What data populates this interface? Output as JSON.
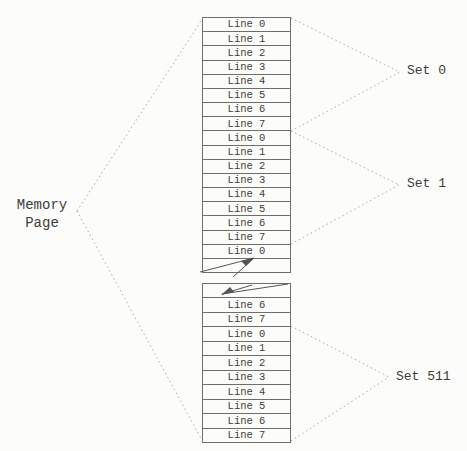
{
  "memory_page": {
    "line1": "Memory",
    "line2": "Page"
  },
  "top_block": {
    "rows": [
      "Line 0",
      "Line 1",
      "Line 2",
      "Line 3",
      "Line 4",
      "Line 5",
      "Line 6",
      "Line 7",
      "Line 0",
      "Line 1",
      "Line 2",
      "Line 3",
      "Line 4",
      "Line 5",
      "Line 6",
      "Line 7",
      "Line 0"
    ]
  },
  "bottom_block": {
    "rows": [
      "Line 6",
      "Line 7",
      "Line 0",
      "Line 1",
      "Line 2",
      "Line 3",
      "Line 4",
      "Line 5",
      "Line 6",
      "Line 7"
    ]
  },
  "set_labels": [
    {
      "label": "Set 0"
    },
    {
      "label": "Set 1"
    },
    {
      "label": "Set 511"
    }
  ],
  "colors": {
    "border": "#6e6e6e",
    "text": "#3c3c3c",
    "dotted": "#a8a8a8",
    "background": "#fcfcfa",
    "zigzag": "#555555"
  }
}
